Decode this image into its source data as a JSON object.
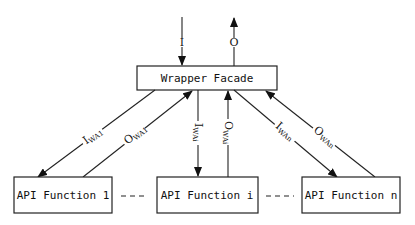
{
  "diagram": {
    "facade": {
      "label": "Wrapper Facade"
    },
    "functions": [
      {
        "label": "API Function 1"
      },
      {
        "label": "API Function i"
      },
      {
        "label": "API Function n"
      }
    ],
    "ellipsis": [
      "- - -",
      "- - -"
    ],
    "top_arrows": {
      "input": {
        "label": "I",
        "direction": "down"
      },
      "output": {
        "label": "O",
        "direction": "up"
      }
    },
    "edges": [
      {
        "main": "I",
        "sub": "WA1",
        "direction": "facade-to-function-1"
      },
      {
        "main": "O",
        "sub": "WA1",
        "direction": "function-1-to-facade"
      },
      {
        "main": "I",
        "sub": "WAi",
        "direction": "facade-to-function-i"
      },
      {
        "main": "O",
        "sub": "WAi",
        "direction": "function-i-to-facade"
      },
      {
        "main": "I",
        "sub": "WAn",
        "direction": "facade-to-function-n"
      },
      {
        "main": "O",
        "sub": "WAn",
        "direction": "function-n-to-facade"
      }
    ]
  }
}
